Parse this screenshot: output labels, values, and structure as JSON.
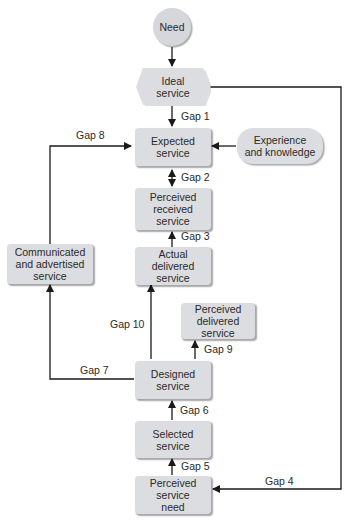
{
  "diagram": {
    "nodes": {
      "need": "Need",
      "ideal": "Ideal\nservice",
      "expected": "Expected\nservice",
      "experience": "Experience\nand knowledge",
      "perceived_received": "Perceived\nreceived\nservice",
      "communicated": "Communicated\nand advertised\nservice",
      "actual_delivered": "Actual\ndelivered\nservice",
      "perceived_delivered": "Perceived\ndelivered\nservice",
      "designed": "Designed\nservice",
      "selected": "Selected\nservice",
      "perceived_need": "Perceived\nservice\nneed"
    },
    "gaps": {
      "gap1": "Gap 1",
      "gap2": "Gap 2",
      "gap3": "Gap 3",
      "gap4": "Gap 4",
      "gap5": "Gap 5",
      "gap6": "Gap 6",
      "gap7": "Gap 7",
      "gap8": "Gap 8",
      "gap9": "Gap 9",
      "gap10": "Gap 10"
    },
    "edges": [
      {
        "from": "Need",
        "to": "Ideal service",
        "label": ""
      },
      {
        "from": "Ideal service",
        "to": "Expected service",
        "label": "Gap 1"
      },
      {
        "from": "Ideal service",
        "to": "Perceived service need",
        "label": "Gap 4"
      },
      {
        "from": "Experience and knowledge",
        "to": "Expected service",
        "label": ""
      },
      {
        "from": "Expected service",
        "to": "Perceived received service",
        "label": "Gap 2",
        "bidirectional": true
      },
      {
        "from": "Actual delivered service",
        "to": "Perceived received service",
        "label": "Gap 3"
      },
      {
        "from": "Communicated and advertised service",
        "to": "Expected service",
        "label": "Gap 8"
      },
      {
        "from": "Designed service",
        "to": "Communicated and advertised service",
        "label": "Gap 7"
      },
      {
        "from": "Designed service",
        "to": "Actual delivered service",
        "label": "Gap 10"
      },
      {
        "from": "Designed service",
        "to": "Perceived delivered service",
        "label": "Gap 9"
      },
      {
        "from": "Selected service",
        "to": "Designed service",
        "label": "Gap 6"
      },
      {
        "from": "Perceived service need",
        "to": "Selected service",
        "label": "Gap 5"
      }
    ],
    "colors": {
      "node_fill": "#dcdde0",
      "line": "#1a1a1a"
    }
  }
}
